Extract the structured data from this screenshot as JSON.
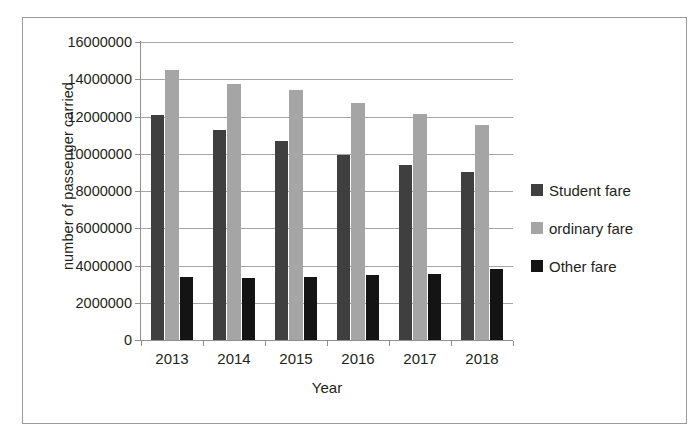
{
  "chart_data": {
    "type": "bar",
    "title": "",
    "xlabel": "Year",
    "ylabel": "number of passenger carried",
    "categories": [
      "2013",
      "2014",
      "2015",
      "2016",
      "2017",
      "2018"
    ],
    "ylim": [
      0,
      16000000
    ],
    "ytick_step": 2000000,
    "ytick_labels": [
      "0",
      "2000000",
      "4000000",
      "6000000",
      "8000000",
      "10000000",
      "12000000",
      "14000000",
      "16000000"
    ],
    "ytick_values": [
      0,
      2000000,
      4000000,
      6000000,
      8000000,
      10000000,
      12000000,
      14000000,
      16000000
    ],
    "grid": true,
    "legend_position": "right",
    "series": [
      {
        "name": "Student fare",
        "color": "#3f3f3f",
        "values": [
          12100000,
          11300000,
          10700000,
          9950000,
          9400000,
          9000000
        ]
      },
      {
        "name": "ordinary fare",
        "color": "#a5a5a5",
        "values": [
          14500000,
          13750000,
          13400000,
          12750000,
          12150000,
          11550000
        ]
      },
      {
        "name": "Other fare",
        "color": "#141414",
        "values": [
          3400000,
          3350000,
          3400000,
          3500000,
          3550000,
          3800000
        ]
      }
    ]
  }
}
